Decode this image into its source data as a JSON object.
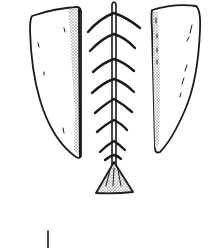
{
  "figure": {
    "colors": {
      "ink": "#1a1a1a",
      "shade": "#9a9a9a",
      "background": "#ffffff"
    },
    "parts": {
      "left_blade": "left-flake",
      "right_blade": "right-flake",
      "shaft": "barbed-shaft",
      "base": "triangular-base",
      "tick": "scale-tick"
    },
    "barb_count": 8
  }
}
